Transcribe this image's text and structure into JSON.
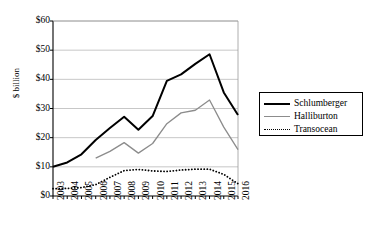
{
  "chart_data": {
    "type": "line",
    "title": "",
    "xlabel": "",
    "ylabel": "$ billion",
    "ylim": [
      0,
      60
    ],
    "ytick_labels": [
      "$0",
      "$10",
      "$20",
      "$30",
      "$40",
      "$50",
      "$60"
    ],
    "ytick_values": [
      0,
      10,
      20,
      30,
      40,
      50,
      60
    ],
    "grid": true,
    "legend_position": "right",
    "categories": [
      "2003",
      "2004",
      "2005",
      "2006",
      "2007",
      "2008",
      "2009",
      "2010",
      "2011",
      "2012",
      "2013",
      "2014",
      "2015",
      "2016"
    ],
    "series": [
      {
        "name": "Schlumberger",
        "color": "#000000",
        "style": "solid",
        "values": [
          10.0,
          11.5,
          14.3,
          19.2,
          23.3,
          27.2,
          22.7,
          27.4,
          39.5,
          41.7,
          45.3,
          48.6,
          35.5,
          27.8
        ]
      },
      {
        "name": "Halliburton",
        "color": "#8c8c8c",
        "style": "solid",
        "values": [
          null,
          null,
          null,
          13.0,
          15.3,
          18.3,
          14.7,
          18.0,
          24.8,
          28.5,
          29.4,
          32.9,
          23.6,
          15.9
        ]
      },
      {
        "name": "Transocean",
        "color": "#000000",
        "style": "dotted",
        "values": [
          2.5,
          2.6,
          2.9,
          3.9,
          6.4,
          8.7,
          9.1,
          8.6,
          8.4,
          8.9,
          9.2,
          9.2,
          7.4,
          4.2
        ]
      }
    ]
  },
  "legend": {
    "items": [
      {
        "label": "Schlumberger"
      },
      {
        "label": "Halliburton"
      },
      {
        "label": "Transocean"
      }
    ]
  }
}
